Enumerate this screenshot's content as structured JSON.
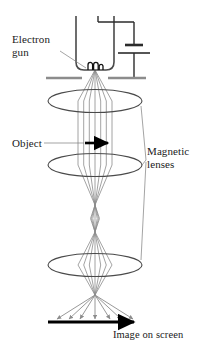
{
  "figure": {
    "type": "diagram",
    "background_color": "#ffffff",
    "ray_color": "#8c8c8c",
    "ink_color": "#4a4a4a",
    "text_color": "#1a1a1a",
    "accent_color": "#000000"
  },
  "labels": {
    "electron_gun": "Electron\ngun",
    "object": "Object",
    "magnetic_lenses": "Magnetic\nlenses",
    "image_on_screen": "Image on screen"
  },
  "components": {
    "electron_gun": {
      "name": "electron-gun",
      "description": "U-shaped evacuated tube with filament coil at base",
      "tube_left_x": 76,
      "tube_right_x": 98,
      "tube_top_y": 16,
      "tube_bottom_y": 70,
      "filament_y": 66
    },
    "battery": {
      "name": "battery-symbol",
      "description": "High-voltage supply drawn as capacitor/battery plates",
      "x": 124,
      "plate_long_y": 53,
      "plate_short_y": 45,
      "wire_top_y": 22,
      "wire_bottom_y": 78
    },
    "anode_plate": {
      "name": "anode-plate",
      "y": 78,
      "left_segment": [
        48,
        80
      ],
      "right_segment": [
        94,
        128
      ],
      "color": "#8c8c8c"
    },
    "magnetic_lenses": [
      {
        "name": "condenser-lens",
        "cx": 95,
        "cy": 101,
        "rx": 47,
        "ry": 11
      },
      {
        "name": "objective-lens",
        "cx": 95,
        "cy": 165,
        "rx": 47,
        "ry": 11
      },
      {
        "name": "projector-lens",
        "cx": 95,
        "cy": 265,
        "rx": 47,
        "ry": 11
      }
    ],
    "object_arrow": {
      "name": "object-specimen-arrow",
      "x1": 85,
      "x2": 112,
      "y": 143,
      "color": "#000000"
    },
    "screen_arrow": {
      "name": "image-screen-arrow",
      "x1": 48,
      "x2": 140,
      "y": 322,
      "color": "#000000"
    },
    "crossover_points": [
      {
        "name": "source-crossover",
        "x": 95,
        "y": 70
      },
      {
        "name": "first-focus",
        "x": 95,
        "y": 205
      },
      {
        "name": "intermediate-image",
        "x": 95,
        "y": 232
      },
      {
        "name": "second-focus",
        "x": 95,
        "y": 295
      }
    ],
    "ray_bundle": {
      "count": 7,
      "half_width_at_lens": 17,
      "description": "Seven electron ray paths forming the beam"
    }
  },
  "leader_lines": [
    {
      "name": "leader-electron-gun",
      "from": [
        62,
        52
      ],
      "to": [
        86,
        68
      ]
    },
    {
      "name": "leader-object",
      "from": [
        44,
        143
      ],
      "to": [
        84,
        143
      ]
    },
    {
      "name": "leader-lens-1",
      "from": [
        142,
        105
      ],
      "to": [
        145,
        158
      ]
    },
    {
      "name": "leader-lens-2",
      "from": [
        142,
        165
      ],
      "to": [
        145,
        160
      ]
    },
    {
      "name": "leader-lens-3",
      "from": [
        142,
        269
      ],
      "to": [
        145,
        163
      ]
    }
  ]
}
